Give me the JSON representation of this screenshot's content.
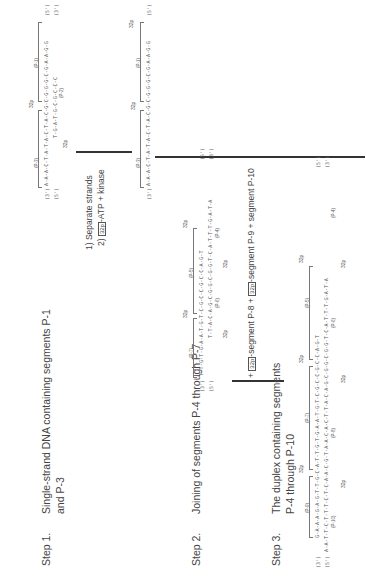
{
  "figure": {
    "orientation": "rotated-90-ccw",
    "steps": [
      {
        "label": "Step 1.",
        "text_line1": "Single-strand DNA containing segments  P-1",
        "text_line2": "and  P-3"
      },
      {
        "label": "Step 2.",
        "text_line1": "Joining of segments  P-4  through  P-7"
      },
      {
        "label": "Step 3.",
        "text_line1": "The duplex containing segments",
        "text_line2": "P-4  through  P-10"
      }
    ],
    "step1_duplex": {
      "top_strand": "A-A-A-C-T-A-T-A-C-T-A-C-G-C-G-G-G-C-G-A-A-G-G",
      "bottom_strand": "T-G-A-T-G-C-G-C-C-C",
      "top_left_end": "(3')",
      "top_right_end": "(5')",
      "bottom_left_end": "(5')",
      "bottom_right_end": "(3')",
      "segments": [
        "(P-3)",
        "(P-1)",
        "(P-2)"
      ],
      "labels_32p": [
        "32p",
        "32p"
      ]
    },
    "reagents": {
      "line1": "1)  Separate strands",
      "line2_prefix": "2)",
      "line2_box": "32p",
      "line2_suffix": "-ATP + kinase"
    },
    "step1_product": {
      "strand": "A-A-A-C-T-A-T-A-C-T-A-C-G-C-G-G-G-C-G-A-A-G-G",
      "left_end": "(3')",
      "right_end": "(5')",
      "segments": [
        "(P-3)",
        "(P-1)"
      ],
      "labels_32p": [
        "32p",
        "32p"
      ]
    },
    "step2_duplex": {
      "top_strand": "T-T-G-T-G-A-A-T-G-T-C-G-C-C-G-C-C-A-G-T",
      "bottom_strand": "T-T-A-C-A-G-C-G-G-C-G-G-T-C-A-T-T-T-G-A-T-A",
      "top_left_end": "(3')",
      "top_right_end": "(5')",
      "bottom_left_end": "(5')",
      "bottom_right_end": "(3')",
      "segments": [
        "(P-7)",
        "(P-5)",
        "(P-6)",
        "(P-4)"
      ],
      "labels_32p": [
        "32p",
        "32p",
        "32p",
        "32p"
      ]
    },
    "step2_reagent": {
      "prefix": "+",
      "box1": "32p",
      "mid1": "-segment  P-8  +",
      "box2": "32p",
      "mid2": "-segment  P-9  + segment  P-10"
    },
    "step3_duplex": {
      "top_strand": "G-A-A-A-G-A-G-T-T-G-C-A-T-T-G-T-G-A-A-T-G-T-C-G-C-C-G-C-C-A-G-T",
      "bottom_strand": "A-A-T-T-C-T-T-T-C-T-C-A-A-C-G-T-A-A-C-A-C-T-T-A-C-A-G-C-G-G-C-G-G-T-C-A-T-T-T-G-A-T-A",
      "top_left_end": "(3')",
      "top_right_end": "(5')",
      "bottom_left_end": "(5')",
      "bottom_right_end": "(3')",
      "segments": [
        "(P-9)",
        "(P-7)",
        "(P-5)",
        "(P-10)",
        "(P-8)",
        "(P-6)",
        "(P-4)"
      ],
      "labels_32p": [
        "32p",
        "32p",
        "32p",
        "32p",
        "32p",
        "32p"
      ]
    }
  }
}
